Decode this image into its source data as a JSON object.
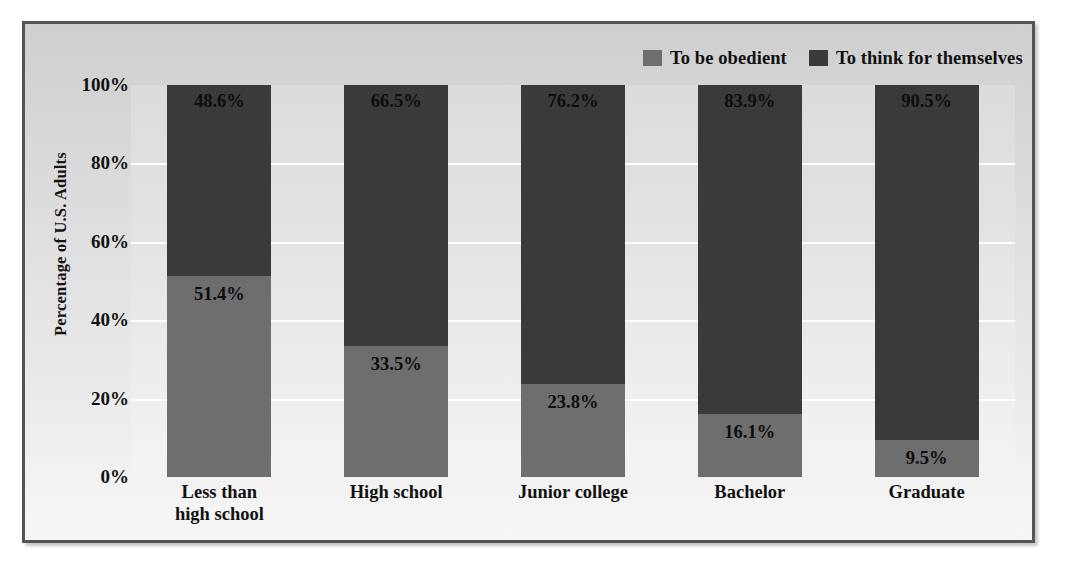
{
  "chart_data": {
    "type": "bar",
    "subtype": "stacked-100-percent",
    "title": "",
    "xlabel": "",
    "ylabel": "Percentage of U.S. Adults",
    "ylim": [
      0,
      100
    ],
    "ytick_labels": [
      "100%",
      "80%",
      "60%",
      "40%",
      "20%",
      "0%"
    ],
    "ytick_values": [
      100,
      80,
      60,
      40,
      20,
      0
    ],
    "grid": true,
    "legend_position": "top-right",
    "categories": [
      "Less than high school",
      "High school",
      "Junior college",
      "Bachelor",
      "Graduate"
    ],
    "category_lines": [
      [
        "Less than",
        "high school"
      ],
      [
        "High school"
      ],
      [
        "Junior college"
      ],
      [
        "Bachelor"
      ],
      [
        "Graduate"
      ]
    ],
    "series": [
      {
        "name": "To be obedient",
        "color": "#6e6e6e",
        "values": [
          51.4,
          33.5,
          23.8,
          16.1,
          9.5
        ],
        "labels": [
          "51.4%",
          "33.5%",
          "23.8%",
          "16.1%",
          "9.5%"
        ]
      },
      {
        "name": "To think for themselves",
        "color": "#3a3a3a",
        "values": [
          48.6,
          66.5,
          76.2,
          83.9,
          90.5
        ],
        "labels": [
          "48.6%",
          "66.5%",
          "76.2%",
          "83.9%",
          "90.5%"
        ]
      }
    ]
  },
  "legend": {
    "items": [
      {
        "label": "To be obedient",
        "color": "#6e6e6e"
      },
      {
        "label": "To think for themselves",
        "color": "#3a3a3a"
      }
    ]
  },
  "colors": {
    "obedient": "#6e6e6e",
    "think_for_themselves": "#3a3a3a",
    "plot_background": "#e2e2e2",
    "figure_background": "#dcdcdc",
    "frame_border": "#545454",
    "gridline": "#ffffff",
    "text": "#111111"
  }
}
